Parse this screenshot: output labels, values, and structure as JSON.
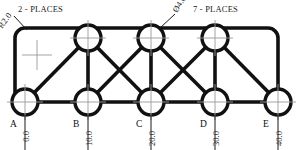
{
  "drawing": {
    "title": "truss-plate-detail",
    "notes": {
      "left_note": "2 - PLACES",
      "right_note": "7 - PLACES",
      "radius_callout": "R2.0",
      "diameter_callout": "Ø4.0"
    },
    "colors": {
      "line": "#111111",
      "centerline": "#9a9a9a",
      "text": "#1a1a1a",
      "background": "#ffffff"
    },
    "bottom_nodes": [
      {
        "label": "A",
        "dimension": "0.0",
        "x": 25,
        "y": 102
      },
      {
        "label": "B",
        "dimension": "10.0",
        "x": 88,
        "y": 102
      },
      {
        "label": "C",
        "dimension": "20.0",
        "x": 151,
        "y": 102
      },
      {
        "label": "D",
        "dimension": "30.0",
        "x": 215,
        "y": 102
      },
      {
        "label": "E",
        "dimension": "40.0",
        "x": 278,
        "y": 102
      }
    ],
    "top_nodes": [
      {
        "x": 88,
        "y": 38
      },
      {
        "x": 151,
        "y": 38
      },
      {
        "x": 215,
        "y": 38
      }
    ],
    "hole_diameter_px": 13,
    "corner_radius_px": 10,
    "geometry": {
      "top_rail_y": 38,
      "bottom_rail_y": 102,
      "left_x": 25,
      "right_x": 278
    }
  }
}
